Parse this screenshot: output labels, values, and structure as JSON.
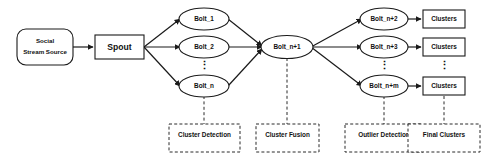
{
  "diagram": {
    "source": {
      "label_line1": "Social",
      "label_line2": "Stream Source"
    },
    "spout": {
      "label": "Spout"
    },
    "cluster_detection_bolts": [
      {
        "label": "Bolt_1"
      },
      {
        "label": "Bolt_2"
      },
      {
        "label": "Bolt_n"
      }
    ],
    "fusion_bolt": {
      "label": "Bolt_n+1"
    },
    "outlier_bolts": [
      {
        "label": "Bolt_n+2"
      },
      {
        "label": "Bolt_n+3"
      },
      {
        "label": "Bolt_n+m"
      }
    ],
    "cluster_outputs": [
      {
        "label": "Clusters"
      },
      {
        "label": "Clusters"
      },
      {
        "label": "Clusters"
      }
    ],
    "phase_labels": [
      {
        "label": "Cluster Detection"
      },
      {
        "label": "Cluster Fusion"
      },
      {
        "label": "Outlier Detection"
      },
      {
        "label": "Final Clusters"
      }
    ],
    "ellipsis": {
      "glyph": "⋮"
    },
    "colors": {
      "stroke": "#1a1a1a",
      "dashed_stroke": "#2b2b2b",
      "fill": "#ffffff",
      "text": "#111111",
      "background": "#ffffff"
    }
  }
}
